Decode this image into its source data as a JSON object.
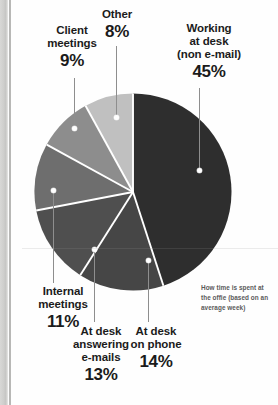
{
  "chart_data": {
    "type": "pie",
    "title": "",
    "caption": [
      "How time is spent at",
      "the offie (based on an",
      "average week)"
    ],
    "start_angle_deg": 0,
    "direction": "clockwise",
    "total_pct": 100,
    "categories": [
      "Working at desk (non e-mail)",
      "At desk on phone",
      "At desk answering e-mails",
      "Internal meetings",
      "Client meetings",
      "Other"
    ],
    "values": [
      45,
      14,
      13,
      11,
      9,
      8
    ],
    "slices": [
      {
        "key": "working",
        "label_lines": [
          "Working",
          "at desk",
          "(non e-mail)"
        ],
        "value": 45,
        "value_text": "45%",
        "color": "#2e2e2e"
      },
      {
        "key": "phone",
        "label_lines": [
          "At desk",
          "on phone"
        ],
        "value": 14,
        "value_text": "14%",
        "color": "#464646"
      },
      {
        "key": "emails",
        "label_lines": [
          "At desk",
          "answering",
          "e-mails"
        ],
        "value": 13,
        "value_text": "13%",
        "color": "#4f4f4f"
      },
      {
        "key": "internal",
        "label_lines": [
          "Internal",
          "meetings"
        ],
        "value": 11,
        "value_text": "11%",
        "color": "#6e6e6e"
      },
      {
        "key": "client",
        "label_lines": [
          "Client",
          "meetings"
        ],
        "value": 9,
        "value_text": "9%",
        "color": "#8d8d8d"
      },
      {
        "key": "other",
        "label_lines": [
          "Other"
        ],
        "value": 8,
        "value_text": "8%",
        "color": "#c0c0c0"
      }
    ],
    "separator_color": "#ffffff",
    "legend_position": "callout-labels",
    "grid": false
  },
  "labels": {
    "other": {
      "line1": "Other",
      "pct": "8%"
    },
    "client": {
      "line1": "Client",
      "line2": "meetings",
      "pct": "9%"
    },
    "working": {
      "line1": "Working",
      "line2": "at desk",
      "line3": "(non e-mail)",
      "pct": "45%"
    },
    "internal": {
      "line1": "Internal",
      "line2": "meetings",
      "pct": "11%"
    },
    "emails": {
      "line1": "At desk",
      "line2": "answering",
      "line3": "e-mails",
      "pct": "13%"
    },
    "phone": {
      "line1": "At desk",
      "line2": "on phone",
      "pct": "14%"
    }
  },
  "caption": {
    "line1": "How time is spent at",
    "line2": "the offie (based on an",
    "line3": "average week)"
  }
}
